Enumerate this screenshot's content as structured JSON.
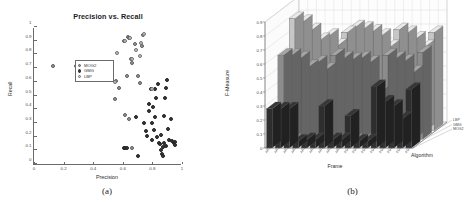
{
  "figure": {
    "panels": [
      {
        "caption": "(a)"
      },
      {
        "caption": "(b)"
      }
    ]
  },
  "panel_a": {
    "caption": "(a)",
    "legend": {
      "entries": [
        {
          "label": "MOG2",
          "color": "#9a9a9a"
        },
        {
          "label": "GMG",
          "color": "#3a3a3a"
        },
        {
          "label": "LBP",
          "color": "#c9c9c9"
        }
      ]
    }
  },
  "panel_b": {
    "caption": "(b)",
    "algorithm_axis_label": "Algorithm",
    "algorithms": [
      "LBP",
      "GMG",
      "MOG2"
    ],
    "colors": {
      "mog2": "#2e2e2e",
      "gmg": "#8c8c8c",
      "lbp": "#c6c6c6"
    }
  },
  "chart_data": [
    {
      "type": "scatter",
      "title": "Precision vs. Recall",
      "xlabel": "Precision",
      "ylabel": "Recall",
      "xlim": [
        0,
        1
      ],
      "ylim": [
        0,
        1
      ],
      "xticks": [
        0,
        0.2,
        0.4,
        0.6,
        0.8,
        1
      ],
      "yticks": [
        0,
        0.1,
        0.2,
        0.3,
        0.4,
        0.5,
        0.6,
        0.7,
        0.8,
        0.9,
        1
      ],
      "grid": false,
      "legend_position": "upper-left",
      "series": [
        {
          "name": "MOG2",
          "color": "#9a9a9a",
          "points": [
            [
              0.125,
              0.715
            ],
            [
              0.285,
              0.712
            ],
            [
              0.545,
              0.475
            ],
            [
              0.555,
              0.605
            ],
            [
              0.575,
              0.555
            ],
            [
              0.605,
              0.895
            ],
            [
              0.625,
              0.64
            ],
            [
              0.635,
              0.93
            ],
            [
              0.645,
              0.92
            ],
            [
              0.655,
              0.77
            ],
            [
              0.665,
              0.735
            ],
            [
              0.685,
              0.875
            ],
            [
              0.7,
              0.64
            ],
            [
              0.715,
              0.595
            ],
            [
              0.73,
              0.86
            ],
            [
              0.735,
              0.945
            ],
            [
              0.615,
              0.36
            ],
            [
              0.64,
              0.33
            ],
            [
              0.66,
              0.115
            ]
          ]
        },
        {
          "name": "GMG",
          "color": "#3a3a3a",
          "points": [
            [
              0.605,
              0.12
            ],
            [
              0.615,
              0.12
            ],
            [
              0.625,
              0.115
            ],
            [
              0.69,
              0.345
            ],
            [
              0.7,
              0.055
            ],
            [
              0.745,
              0.3
            ],
            [
              0.76,
              0.24
            ],
            [
              0.765,
              0.205
            ],
            [
              0.775,
              0.44
            ],
            [
              0.78,
              0.385
            ],
            [
              0.79,
              0.545
            ],
            [
              0.795,
              0.3
            ],
            [
              0.8,
              0.175
            ],
            [
              0.805,
              0.415
            ],
            [
              0.81,
              0.25
            ],
            [
              0.815,
              0.34
            ],
            [
              0.82,
              0.545
            ],
            [
              0.825,
              0.48
            ],
            [
              0.83,
              0.195
            ],
            [
              0.84,
              0.585
            ],
            [
              0.845,
              0.15
            ],
            [
              0.85,
              0.145
            ],
            [
              0.855,
              0.21
            ],
            [
              0.86,
              0.1
            ],
            [
              0.865,
              0.07
            ],
            [
              0.87,
              0.055
            ],
            [
              0.88,
              0.35
            ],
            [
              0.885,
              0.48
            ],
            [
              0.89,
              0.555
            ],
            [
              0.9,
              0.61
            ],
            [
              0.905,
              0.255
            ],
            [
              0.915,
              0.175
            ],
            [
              0.925,
              0.33
            ],
            [
              0.935,
              0.165
            ],
            [
              0.945,
              0.155
            ],
            [
              0.95,
              0.14
            ],
            [
              0.955,
              0.16
            ],
            [
              0.88,
              0.15
            ],
            [
              0.895,
              0.13
            ],
            [
              0.87,
              0.125
            ]
          ]
        },
        {
          "name": "LBP",
          "color": "#c9c9c9",
          "points": [
            [
              0.56,
              0.81
            ],
            [
              0.612,
              0.9
            ],
            [
              0.648,
              0.92
            ],
            [
              0.69,
              0.83
            ],
            [
              0.722,
              0.88
            ],
            [
              0.742,
              0.95
            ],
            [
              0.716,
              0.79
            ],
            [
              0.662,
              0.765
            ],
            [
              0.548,
              0.6
            ],
            [
              0.8,
              0.545
            ]
          ]
        }
      ]
    },
    {
      "type": "bar",
      "title": "F-Measure",
      "xlabel": "Frame",
      "ylabel": "F-Measure",
      "zlabel": "Algorithm",
      "ylim": [
        0,
        0.9
      ],
      "yticks": [
        0,
        0.1,
        0.2,
        0.3,
        0.4,
        0.5,
        0.6,
        0.7,
        0.8,
        0.9
      ],
      "grid": true,
      "projection": "3d",
      "categories": [
        "AR1-1",
        "AR1-2",
        "AR1-3",
        "AR2-1",
        "AR2-2",
        "AR2-3",
        "AR3-1",
        "AR3-2",
        "AR3-3",
        "PD1-1",
        "PD1-2",
        "PD1-3",
        "PD2-1",
        "PD2-2",
        "PD2-3",
        "PD3-1",
        "PD3-2"
      ],
      "series": [
        {
          "name": "MOG2",
          "color": "#2e2e2e",
          "values": [
            0.28,
            0.28,
            0.28,
            0.05,
            0.06,
            0.06,
            0.3,
            0.06,
            0.06,
            0.23,
            0.05,
            0.05,
            0.44,
            0.33,
            0.3,
            0.21,
            0.42
          ]
        },
        {
          "name": "GMG",
          "color": "#8c8c8c",
          "values": [
            0.6,
            0.6,
            0.58,
            0.52,
            0.55,
            0.5,
            0.6,
            0.58,
            0.57,
            0.58,
            0.55,
            0.33,
            0.6,
            0.58,
            0.56,
            0.48,
            0.62
          ]
        },
        {
          "name": "LBP",
          "color": "#c6c6c6",
          "values": [
            0.8,
            0.78,
            0.72,
            0.65,
            0.68,
            0.61,
            0.7,
            0.74,
            0.73,
            0.71,
            0.68,
            0.6,
            0.72,
            0.7,
            0.66,
            0.6,
            0.7
          ]
        }
      ]
    }
  ]
}
